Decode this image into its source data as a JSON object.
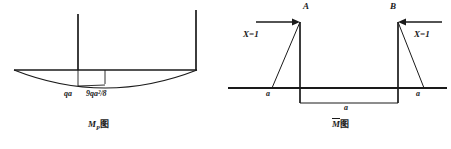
{
  "figure": {
    "kind": "structural-mechanics-bending-moment-diagrams",
    "panels": [
      {
        "id": "left",
        "caption_symbol": "M",
        "caption_subscript": "P",
        "caption_suffix": "图",
        "caption_full": "MP图",
        "labels": [
          {
            "name": "qa-label",
            "text": "qa",
            "x": 67,
            "y": 95
          },
          {
            "name": "moment-label",
            "text": "9qa²/8",
            "x": 88,
            "y": 95
          }
        ],
        "diagram": {
          "type": "parabolic-moment-diagram",
          "baseline": {
            "x1": 14,
            "y1": 70,
            "x2": 197,
            "y2": 70
          },
          "verticals": [
            {
              "name": "left-vertical",
              "x": 78,
              "y_top": 14,
              "y_bottom": 70
            },
            {
              "name": "right-vertical",
              "x": 196,
              "y_top": 10,
              "y_bottom": 70
            }
          ],
          "parabola": {
            "x_start": 14,
            "x_end": 197,
            "y_base": 70,
            "sag": 18
          },
          "rectangle": {
            "x1": 78,
            "x2": 105,
            "y_top": 70,
            "y_bottom": 86
          }
        }
      },
      {
        "id": "right",
        "caption_symbol": "M",
        "caption_overbar": true,
        "caption_suffix": "图",
        "caption_full": "M̄图",
        "node_labels": [
          {
            "name": "node-label-a",
            "text": "A",
            "x": 306,
            "y": 5
          },
          {
            "name": "node-label-b",
            "text": "B",
            "x": 392,
            "y": 5
          }
        ],
        "force_labels": [
          {
            "name": "force-label-left",
            "text": "X=1",
            "x": 243,
            "y": 34,
            "direction": "right"
          },
          {
            "name": "force-label-right",
            "text": "X=1",
            "x": 418,
            "y": 34,
            "direction": "left"
          }
        ],
        "dimension_labels": [
          {
            "name": "dim-label-left",
            "text": "a",
            "x": 268,
            "y": 94
          },
          {
            "name": "dim-label-center",
            "text": "a",
            "x": 345,
            "y": 106
          },
          {
            "name": "dim-label-right",
            "text": "a",
            "x": 418,
            "y": 94
          }
        ],
        "diagram": {
          "type": "unit-force-moment-diagram",
          "baseline": {
            "x1": 228,
            "y1": 88,
            "x2": 447,
            "y2": 88
          },
          "columns": [
            {
              "name": "column-a",
              "x": 300,
              "y_top": 22,
              "y_bottom": 103
            },
            {
              "name": "column-b",
              "x": 398,
              "y_top": 22,
              "y_bottom": 103
            }
          ],
          "triangles": [
            {
              "name": "triangle-a",
              "apex_x": 300,
              "apex_y": 22,
              "foot_x": 272,
              "foot_y": 88
            },
            {
              "name": "triangle-b",
              "apex_x": 398,
              "apex_y": 22,
              "foot_x": 424,
              "foot_y": 88
            }
          ],
          "span_rectangle": {
            "x1": 300,
            "x2": 398,
            "y_top": 88,
            "y_bottom": 103
          },
          "arrows": [
            {
              "name": "arrow-left",
              "x_tail": 256,
              "x_head": 299,
              "y": 22
            },
            {
              "name": "arrow-right",
              "x_tail": 442,
              "x_head": 399,
              "y": 22
            }
          ]
        }
      }
    ]
  },
  "style": {
    "stroke": "#1a1a1a",
    "thick_stroke": "#2b2b2b",
    "background": "#ffffff"
  }
}
